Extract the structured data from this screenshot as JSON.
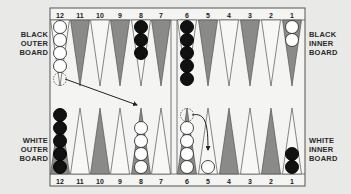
{
  "labels": {
    "black_outer": [
      "BLACK",
      "OUTER",
      "BOARD"
    ],
    "black_inner": [
      "BLACK",
      "INNER",
      "BOARD"
    ],
    "white_outer": [
      "WHITE",
      "OUTER",
      "BOARD"
    ],
    "white_inner": [
      "WHITE",
      "INNER",
      "BOARD"
    ]
  },
  "colors": {
    "background": "#e9e9e7",
    "board": "#f4f4f2",
    "dark_point": "#8a8a88",
    "light_point": "#f7f7f5",
    "outline": "#555555",
    "black_checker": "#111111",
    "white_checker": "#ffffff"
  },
  "top_points": [
    {
      "num": "12",
      "cx": 60,
      "shade": "light",
      "checkers": {
        "color": "white",
        "count": 4,
        "ghost": true
      }
    },
    {
      "num": "11",
      "cx": 80,
      "shade": "dark"
    },
    {
      "num": "10",
      "cx": 100,
      "shade": "light"
    },
    {
      "num": "9",
      "cx": 120,
      "shade": "dark"
    },
    {
      "num": "8",
      "cx": 141,
      "shade": "light",
      "checkers": {
        "color": "black",
        "count": 3
      }
    },
    {
      "num": "7",
      "cx": 161,
      "shade": "dark"
    },
    {
      "num": "6",
      "cx": 187,
      "shade": "light",
      "checkers": {
        "color": "black",
        "count": 5
      }
    },
    {
      "num": "5",
      "cx": 208,
      "shade": "dark"
    },
    {
      "num": "4",
      "cx": 229,
      "shade": "light"
    },
    {
      "num": "3",
      "cx": 250,
      "shade": "dark"
    },
    {
      "num": "2",
      "cx": 271,
      "shade": "light"
    },
    {
      "num": "1",
      "cx": 292,
      "shade": "dark",
      "checkers": {
        "color": "white",
        "count": 2
      }
    }
  ],
  "bottom_points": [
    {
      "num": "12",
      "cx": 60,
      "shade": "dark",
      "checkers": {
        "color": "black",
        "count": 5
      }
    },
    {
      "num": "11",
      "cx": 80,
      "shade": "light"
    },
    {
      "num": "10",
      "cx": 100,
      "shade": "dark"
    },
    {
      "num": "9",
      "cx": 120,
      "shade": "light"
    },
    {
      "num": "8",
      "cx": 141,
      "shade": "dark",
      "checkers": {
        "color": "white",
        "count": 4
      }
    },
    {
      "num": "7",
      "cx": 161,
      "shade": "light"
    },
    {
      "num": "6",
      "cx": 187,
      "shade": "dark",
      "checkers": {
        "color": "white",
        "count": 4,
        "ghost": true
      }
    },
    {
      "num": "5",
      "cx": 208,
      "shade": "light",
      "checkers": {
        "color": "white",
        "count": 1
      }
    },
    {
      "num": "4",
      "cx": 229,
      "shade": "dark"
    },
    {
      "num": "3",
      "cx": 250,
      "shade": "light"
    },
    {
      "num": "2",
      "cx": 271,
      "shade": "dark"
    },
    {
      "num": "1",
      "cx": 292,
      "shade": "light",
      "checkers": {
        "color": "black",
        "count": 2
      }
    }
  ],
  "moves": [
    {
      "from": "top-12",
      "to": "bottom-8",
      "type": "straight"
    },
    {
      "from": "bottom-6",
      "to": "bottom-5",
      "type": "curved"
    }
  ]
}
